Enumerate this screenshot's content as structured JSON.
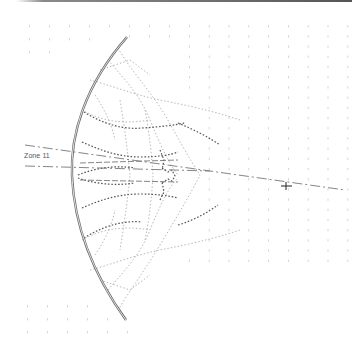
{
  "diagram": {
    "zone_label": "Zone 11",
    "colors": {
      "reflector": "#6a6a6a",
      "ray_dark": "#4a4a4a",
      "ray_light": "#9a9a9a",
      "grid_dot": "#c8c8c8",
      "axis_line": "#7a7a7a",
      "top_bar": "#6e6e6e"
    },
    "focal_marker": "cross-marker",
    "reflector_shape": "curved-reflector"
  }
}
